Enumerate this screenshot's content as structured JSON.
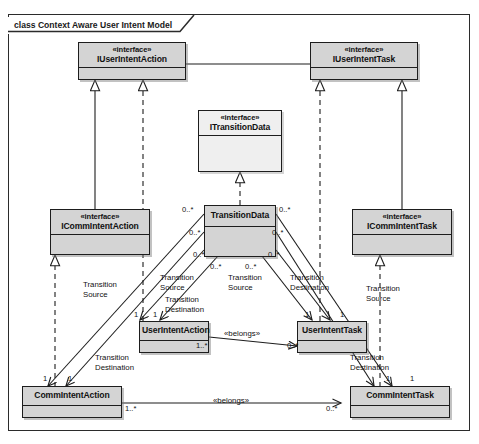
{
  "diagram": {
    "frame_label": "class Context Aware User Intent Model",
    "nodes": {
      "iuseri_action": {
        "stereotype": "«interface»",
        "name": "IUserIntentAction"
      },
      "iuseri_task": {
        "stereotype": "«interface»",
        "name": "IUserIntentTask"
      },
      "itransdata": {
        "stereotype": "«interface»",
        "name": "ITransitionData"
      },
      "icomm_action": {
        "stereotype": "«interface»",
        "name": "ICommIntentAction"
      },
      "icomm_task": {
        "stereotype": "«interface»",
        "name": "ICommIntentTask"
      },
      "transdata": {
        "stereotype": "",
        "name": "TransitionData"
      },
      "useri_action": {
        "stereotype": "",
        "name": "UserIntentAction"
      },
      "useri_task": {
        "stereotype": "",
        "name": "UserIntentTask"
      },
      "comm_action": {
        "stereotype": "",
        "name": "CommIntentAction"
      },
      "comm_task": {
        "stereotype": "",
        "name": "CommIntentTask"
      }
    },
    "role_labels": [
      {
        "id": "rl1",
        "line1": "Transition",
        "line2": "Source"
      },
      {
        "id": "rl2",
        "line1": "Transition",
        "line2": "Source"
      },
      {
        "id": "rl3",
        "line1": "Transition",
        "line2": "Destination"
      },
      {
        "id": "rl4",
        "line1": "Transition",
        "line2": "Source"
      },
      {
        "id": "rl5",
        "line1": "Transition",
        "line2": "Destination"
      },
      {
        "id": "rl6",
        "line1": "Transition",
        "line2": "Source"
      },
      {
        "id": "rl7",
        "line1": "Transition",
        "line2": "Destination"
      },
      {
        "id": "rl8",
        "line1": "Transition",
        "line2": "Destination"
      }
    ],
    "multiplicities": {
      "td_left_top": "0..*",
      "td_left_mid": "0..*",
      "td_left_bot": "0..*",
      "td_right_top": "0..*",
      "td_right_mid": "0..*",
      "td_right_bot": "0..*",
      "td_bot_left": "0..*",
      "td_bot_right": "0..*",
      "ua_top_left": "1",
      "ua_top_right": "1",
      "ut_top_left": "1",
      "ut_top_right": "1",
      "ca_top_left": "1",
      "ca_top_right": "1",
      "ct_top_left": "1",
      "ct_top_right": "1",
      "belongs_user_src": "1..*",
      "belongs_user_dst": "0..*",
      "belongs_comm_src": "1..*",
      "belongs_comm_dst": "0..*"
    },
    "associations": {
      "belongs_user": "«belongs»",
      "belongs_comm": "«belongs»"
    }
  }
}
